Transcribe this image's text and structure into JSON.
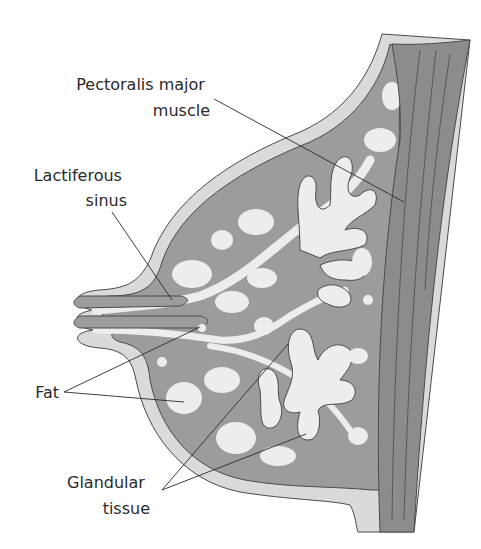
{
  "figure": {
    "colors": {
      "background": "#ffffff",
      "skin": "#dadada",
      "tissue": "#9c9c9c",
      "muscle": "#8c8c8c",
      "lobule": "#ededed",
      "outline": "#4a4a4a",
      "leader": "#2a2a2a",
      "text": "#2a2a2a"
    },
    "labels": [
      {
        "id": "pectoralis",
        "lines": [
          "Pectoralis major",
          "muscle"
        ]
      },
      {
        "id": "lactiferous",
        "lines": [
          "Lactiferous",
          "sinus"
        ]
      },
      {
        "id": "fat",
        "lines": [
          "Fat"
        ]
      },
      {
        "id": "glandular",
        "lines": [
          "Glandular",
          "tissue"
        ]
      }
    ]
  }
}
